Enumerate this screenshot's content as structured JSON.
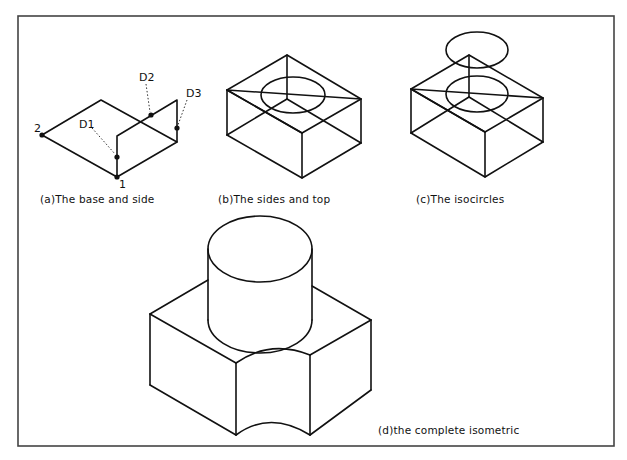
{
  "figures": {
    "a": {
      "caption": "(a)The base and side",
      "point_labels": {
        "p1": "1",
        "p2": "2",
        "d1": "D1",
        "d2": "D2",
        "d3": "D3"
      }
    },
    "b": {
      "caption": "(b)The sides and top"
    },
    "c": {
      "caption": "(c)The isocircles"
    },
    "d": {
      "caption": "(d)the complete isometric"
    }
  },
  "colors": {
    "line": "#111111",
    "frame": "#444444",
    "background": "#ffffff"
  }
}
